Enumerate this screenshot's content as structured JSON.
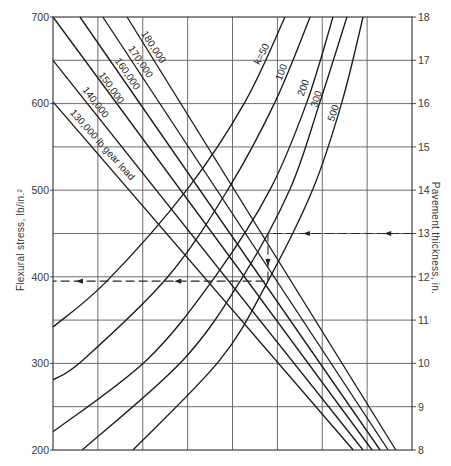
{
  "chart_data": {
    "type": "line",
    "title": "",
    "xlabel": "",
    "ylabel": "Flexural stress, lb/in.²",
    "y2label": "Pavement thickness, in.",
    "xlim": [
      0,
      8
    ],
    "ylim": [
      200,
      700
    ],
    "y2lim": [
      8,
      18
    ],
    "yticks": [
      200,
      300,
      400,
      500,
      600,
      700
    ],
    "ytick_labels": [
      "200",
      "300",
      "400",
      "500",
      "600",
      "700"
    ],
    "y2ticks": [
      8,
      9,
      10,
      11,
      12,
      13,
      14,
      15,
      16,
      17,
      18
    ],
    "y2tick_labels": [
      "8",
      "9",
      "10",
      "11",
      "12",
      "13",
      "14",
      "15",
      "16",
      "17",
      "18"
    ],
    "grid": {
      "on": true,
      "x_lines": [
        1,
        2,
        3,
        4,
        5,
        6,
        7
      ],
      "y_lines": [
        250,
        300,
        350,
        400,
        450,
        500,
        550,
        600,
        650
      ]
    },
    "legend": "none (curves labeled inline)",
    "colors": {
      "line": "#1c1c1c",
      "grid": "#5e5e5e",
      "text": "#383838"
    },
    "series": [
      {
        "group": "gear_load",
        "name": "130,000 lb gear load",
        "points": [
          [
            0,
            602
          ],
          [
            6.69,
            200
          ]
        ]
      },
      {
        "group": "gear_load",
        "name": "140,000",
        "points": [
          [
            0,
            650
          ],
          [
            6.91,
            200
          ]
        ]
      },
      {
        "group": "gear_load",
        "name": "150,000",
        "points": [
          [
            0,
            700
          ],
          [
            7.11,
            200
          ]
        ]
      },
      {
        "group": "gear_load",
        "name": "160,000",
        "points": [
          [
            0.6,
            700
          ],
          [
            7.29,
            200
          ]
        ]
      },
      {
        "group": "gear_load",
        "name": "170,000",
        "points": [
          [
            1.11,
            700
          ],
          [
            7.47,
            200
          ]
        ]
      },
      {
        "group": "gear_load",
        "name": "180,000",
        "points": [
          [
            1.65,
            700
          ],
          [
            7.64,
            200
          ]
        ]
      },
      {
        "group": "k_value",
        "name": "k=50",
        "points": [
          [
            0,
            342
          ],
          [
            1.2,
            395
          ],
          [
            2.99,
            501
          ],
          [
            4.28,
            602
          ],
          [
            5.17,
            700
          ]
        ]
      },
      {
        "group": "k_value",
        "name": "100",
        "points": [
          [
            0,
            281
          ],
          [
            0.67,
            304
          ],
          [
            2.56,
            400
          ],
          [
            3.9,
            501
          ],
          [
            4.95,
            602
          ],
          [
            5.73,
            700
          ]
        ]
      },
      {
        "group": "k_value",
        "name": "200",
        "points": [
          [
            0,
            221
          ],
          [
            2.09,
            304
          ],
          [
            3.61,
            400
          ],
          [
            4.84,
            501
          ],
          [
            5.66,
            602
          ],
          [
            6.24,
            700
          ]
        ]
      },
      {
        "group": "k_value",
        "name": "300",
        "points": [
          [
            0.65,
            200
          ],
          [
            2.9,
            304
          ],
          [
            4.23,
            400
          ],
          [
            5.28,
            501
          ],
          [
            5.95,
            602
          ],
          [
            6.55,
            700
          ]
        ]
      },
      {
        "group": "k_value",
        "name": "500",
        "points": [
          [
            1.78,
            200
          ],
          [
            3.72,
            304
          ],
          [
            4.79,
            395
          ],
          [
            5.79,
            501
          ],
          [
            6.44,
            602
          ],
          [
            6.91,
            700
          ]
        ]
      }
    ],
    "annotations": [
      {
        "text": "180,000",
        "x": 2.23,
        "y": 665,
        "angle": 57
      },
      {
        "text": "170,000",
        "x": 1.94,
        "y": 648,
        "angle": 56
      },
      {
        "text": "160,000",
        "x": 1.65,
        "y": 634,
        "angle": 55
      },
      {
        "text": "150,000",
        "x": 1.29,
        "y": 618,
        "angle": 54
      },
      {
        "text": "140,000",
        "x": 0.94,
        "y": 601,
        "angle": 52
      },
      {
        "text": "130,000 lb gear load",
        "x": 1.09,
        "y": 552,
        "angle": 48
      },
      {
        "text": "k=50",
        "x": 4.66,
        "y": 657,
        "angle": -62
      },
      {
        "text": "100",
        "x": 5.1,
        "y": 636,
        "angle": -68
      },
      {
        "text": "200",
        "x": 5.59,
        "y": 618,
        "angle": -70
      },
      {
        "text": "300",
        "x": 5.88,
        "y": 605,
        "angle": -71
      },
      {
        "text": "500",
        "x": 6.26,
        "y": 589,
        "angle": -72
      }
    ],
    "example_path": {
      "entry_thickness_in": 13,
      "result_stress": 395,
      "points": [
        [
          8,
          450
        ],
        [
          4.79,
          450
        ],
        [
          4.79,
          395
        ],
        [
          0,
          395
        ]
      ],
      "arrows": [
        {
          "x": 7.47,
          "y": 450,
          "dir": "left"
        },
        {
          "x": 5.66,
          "y": 450,
          "dir": "left"
        },
        {
          "x": 4.79,
          "y": 417,
          "dir": "down"
        },
        {
          "x": 2.79,
          "y": 395,
          "dir": "left"
        },
        {
          "x": 0.6,
          "y": 395,
          "dir": "left"
        }
      ]
    }
  }
}
